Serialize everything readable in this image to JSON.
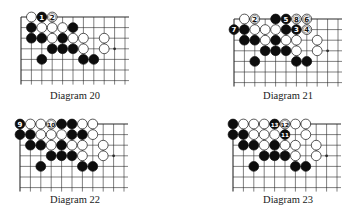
{
  "colors": {
    "black_stone": "#0d0d0d",
    "white_stone": "#ffffff",
    "line": "#2a2a2a",
    "label_on_black": "#ffffff",
    "label_on_white": "#111111"
  },
  "diagrams": [
    {
      "caption": "Diagram 20",
      "origin": [
        21,
        17
      ],
      "cols": 11,
      "rows": 7,
      "star": [
        [
          9,
          3
        ]
      ],
      "stones": [
        {
          "c": 1,
          "r": 0,
          "color": "W"
        },
        {
          "c": 2,
          "r": 0,
          "color": "B",
          "label": "1"
        },
        {
          "c": 3,
          "r": 0,
          "color": "W",
          "label": "2"
        },
        {
          "c": 1,
          "r": 1,
          "color": "B"
        },
        {
          "c": 2,
          "r": 1,
          "color": "W"
        },
        {
          "c": 3,
          "r": 1,
          "color": "W"
        },
        {
          "c": 4,
          "r": 1,
          "color": "W"
        },
        {
          "c": 5,
          "r": 1,
          "color": "B"
        },
        {
          "c": 1,
          "r": 2,
          "color": "B"
        },
        {
          "c": 2,
          "r": 2,
          "color": "B"
        },
        {
          "c": 3,
          "r": 2,
          "color": "W"
        },
        {
          "c": 4,
          "r": 2,
          "color": "B"
        },
        {
          "c": 5,
          "r": 2,
          "color": "W"
        },
        {
          "c": 6,
          "r": 2,
          "color": "W"
        },
        {
          "c": 8,
          "r": 2,
          "color": "W"
        },
        {
          "c": 3,
          "r": 3,
          "color": "B"
        },
        {
          "c": 4,
          "r": 3,
          "color": "B"
        },
        {
          "c": 5,
          "r": 3,
          "color": "B"
        },
        {
          "c": 6,
          "r": 3,
          "color": "W"
        },
        {
          "c": 8,
          "r": 3,
          "color": "W"
        },
        {
          "c": 2,
          "r": 4,
          "color": "B"
        },
        {
          "c": 6,
          "r": 4,
          "color": "B"
        },
        {
          "c": 7,
          "r": 4,
          "color": "B"
        }
      ]
    },
    {
      "caption": "Diagram 21",
      "origin": [
        234,
        19
      ],
      "cols": 11,
      "rows": 7,
      "star": [
        [
          9,
          3
        ]
      ],
      "stones": [
        {
          "c": 1,
          "r": 0,
          "color": "W"
        },
        {
          "c": 2,
          "r": 0,
          "color": "W",
          "label": "2"
        },
        {
          "c": 4,
          "r": 0,
          "color": "B"
        },
        {
          "c": 5,
          "r": 0,
          "color": "B",
          "label": "5"
        },
        {
          "c": 6,
          "r": 0,
          "color": "W",
          "label": "8"
        },
        {
          "c": 7,
          "r": 0,
          "color": "W",
          "label": "6"
        },
        {
          "c": 0,
          "r": 1,
          "color": "B",
          "label": "7"
        },
        {
          "c": 1,
          "r": 1,
          "color": "B"
        },
        {
          "c": 2,
          "r": 1,
          "color": "W"
        },
        {
          "c": 3,
          "r": 1,
          "color": "W"
        },
        {
          "c": 4,
          "r": 1,
          "color": "W"
        },
        {
          "c": 5,
          "r": 1,
          "color": "B"
        },
        {
          "c": 6,
          "r": 1,
          "color": "B",
          "label": "3"
        },
        {
          "c": 7,
          "r": 1,
          "color": "W",
          "label": "4"
        },
        {
          "c": 1,
          "r": 2,
          "color": "B"
        },
        {
          "c": 2,
          "r": 2,
          "color": "B"
        },
        {
          "c": 3,
          "r": 2,
          "color": "W"
        },
        {
          "c": 4,
          "r": 2,
          "color": "B"
        },
        {
          "c": 5,
          "r": 2,
          "color": "W"
        },
        {
          "c": 6,
          "r": 2,
          "color": "W"
        },
        {
          "c": 8,
          "r": 2,
          "color": "W"
        },
        {
          "c": 3,
          "r": 3,
          "color": "B"
        },
        {
          "c": 4,
          "r": 3,
          "color": "B"
        },
        {
          "c": 5,
          "r": 3,
          "color": "B"
        },
        {
          "c": 6,
          "r": 3,
          "color": "W"
        },
        {
          "c": 8,
          "r": 3,
          "color": "W"
        },
        {
          "c": 2,
          "r": 4,
          "color": "B"
        },
        {
          "c": 6,
          "r": 4,
          "color": "B"
        },
        {
          "c": 7,
          "r": 4,
          "color": "B"
        }
      ]
    },
    {
      "caption": "Diagram 22",
      "origin": [
        20,
        124
      ],
      "cols": 11,
      "rows": 7,
      "star": [
        [
          9,
          3
        ]
      ],
      "stones": [
        {
          "c": 0,
          "r": 0,
          "color": "B",
          "label": "9"
        },
        {
          "c": 1,
          "r": 0,
          "color": "W"
        },
        {
          "c": 2,
          "r": 0,
          "color": "W"
        },
        {
          "c": 3,
          "r": 0,
          "color": "W",
          "label": "10"
        },
        {
          "c": 4,
          "r": 0,
          "color": "B"
        },
        {
          "c": 5,
          "r": 0,
          "color": "B"
        },
        {
          "c": 6,
          "r": 0,
          "color": "W"
        },
        {
          "c": 7,
          "r": 0,
          "color": "W"
        },
        {
          "c": 0,
          "r": 1,
          "color": "B"
        },
        {
          "c": 1,
          "r": 1,
          "color": "B"
        },
        {
          "c": 2,
          "r": 1,
          "color": "W"
        },
        {
          "c": 3,
          "r": 1,
          "color": "W"
        },
        {
          "c": 4,
          "r": 1,
          "color": "W"
        },
        {
          "c": 5,
          "r": 1,
          "color": "B"
        },
        {
          "c": 6,
          "r": 1,
          "color": "B"
        },
        {
          "c": 7,
          "r": 1,
          "color": "W"
        },
        {
          "c": 1,
          "r": 2,
          "color": "B"
        },
        {
          "c": 2,
          "r": 2,
          "color": "B"
        },
        {
          "c": 3,
          "r": 2,
          "color": "W"
        },
        {
          "c": 4,
          "r": 2,
          "color": "B"
        },
        {
          "c": 5,
          "r": 2,
          "color": "W"
        },
        {
          "c": 6,
          "r": 2,
          "color": "W"
        },
        {
          "c": 8,
          "r": 2,
          "color": "W"
        },
        {
          "c": 3,
          "r": 3,
          "color": "B"
        },
        {
          "c": 4,
          "r": 3,
          "color": "B"
        },
        {
          "c": 5,
          "r": 3,
          "color": "B"
        },
        {
          "c": 6,
          "r": 3,
          "color": "W"
        },
        {
          "c": 8,
          "r": 3,
          "color": "W"
        },
        {
          "c": 2,
          "r": 4,
          "color": "B"
        },
        {
          "c": 6,
          "r": 4,
          "color": "B"
        },
        {
          "c": 7,
          "r": 4,
          "color": "B"
        }
      ]
    },
    {
      "caption": "Diagram 23",
      "origin": [
        233,
        124
      ],
      "cols": 11,
      "rows": 7,
      "star": [
        [
          9,
          3
        ]
      ],
      "stones": [
        {
          "c": 0,
          "r": 0,
          "color": "B"
        },
        {
          "c": 1,
          "r": 0,
          "color": "W"
        },
        {
          "c": 2,
          "r": 0,
          "color": "W"
        },
        {
          "c": 3,
          "r": 0,
          "color": "W"
        },
        {
          "c": 4,
          "r": 0,
          "color": "B",
          "label": "13"
        },
        {
          "c": 5,
          "r": 0,
          "color": "W",
          "label": "12"
        },
        {
          "c": 6,
          "r": 0,
          "color": "W"
        },
        {
          "c": 7,
          "r": 0,
          "color": "W"
        },
        {
          "c": 0,
          "r": 1,
          "color": "B"
        },
        {
          "c": 1,
          "r": 1,
          "color": "B"
        },
        {
          "c": 2,
          "r": 1,
          "color": "W"
        },
        {
          "c": 3,
          "r": 1,
          "color": "W"
        },
        {
          "c": 4,
          "r": 1,
          "color": "W"
        },
        {
          "c": 5,
          "r": 1,
          "color": "B",
          "label": "11"
        },
        {
          "c": 7,
          "r": 1,
          "color": "W"
        },
        {
          "c": 1,
          "r": 2,
          "color": "B"
        },
        {
          "c": 2,
          "r": 2,
          "color": "B"
        },
        {
          "c": 3,
          "r": 2,
          "color": "W"
        },
        {
          "c": 4,
          "r": 2,
          "color": "B"
        },
        {
          "c": 5,
          "r": 2,
          "color": "W"
        },
        {
          "c": 6,
          "r": 2,
          "color": "W"
        },
        {
          "c": 8,
          "r": 2,
          "color": "W"
        },
        {
          "c": 3,
          "r": 3,
          "color": "B"
        },
        {
          "c": 4,
          "r": 3,
          "color": "B"
        },
        {
          "c": 5,
          "r": 3,
          "color": "B"
        },
        {
          "c": 6,
          "r": 3,
          "color": "W"
        },
        {
          "c": 8,
          "r": 3,
          "color": "W"
        },
        {
          "c": 2,
          "r": 4,
          "color": "B"
        },
        {
          "c": 6,
          "r": 4,
          "color": "B"
        },
        {
          "c": 7,
          "r": 4,
          "color": "B"
        }
      ]
    }
  ]
}
